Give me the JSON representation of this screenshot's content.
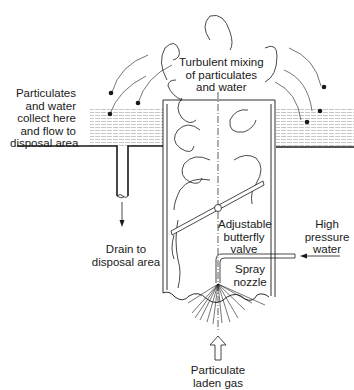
{
  "diagram": {
    "labels": {
      "turbulent": "Turbulent mixing\nof particulates\nand water",
      "collect": "Particulates\nand water\ncollect here\nand flow to\ndisposal area",
      "drain": "Drain to\ndisposal area",
      "valve": "Adjustable\nbutterfly\nvalve",
      "high_pressure": "High\npressure\nwater",
      "spray": "Spray\nnozzle",
      "gas": "Particulate\nladen gas"
    },
    "colors": {
      "line": "#1a1a1a",
      "hatch": "#9a9a9a",
      "background": "#ffffff"
    }
  }
}
